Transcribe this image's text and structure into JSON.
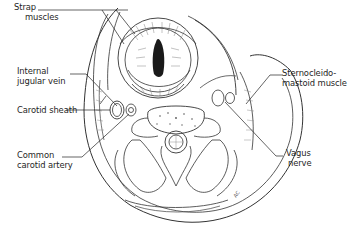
{
  "diagram": {
    "type": "anatomical cross-section",
    "labels": {
      "strap_muscles": [
        "Strap",
        "muscles"
      ],
      "internal_jugular_vein": [
        "Internal",
        "jugular vein"
      ],
      "carotid_sheath": [
        "Carotid sheath"
      ],
      "common_carotid_artery": [
        "Common",
        "carotid artery"
      ],
      "sternocleidomastoid": [
        "Sternocleido-",
        "mastoid muscle"
      ],
      "vagus_nerve": [
        "Vagus",
        "nerve"
      ]
    },
    "artist_signature": "AC"
  }
}
